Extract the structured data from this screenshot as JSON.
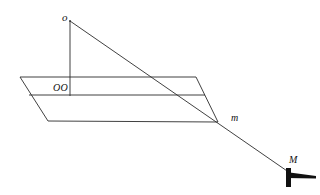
{
  "figure": {
    "background_color": "#ffffff",
    "stroke_color": "#2b2b2b",
    "support_color": "#111111",
    "labels": {
      "apex": "o",
      "plane_point": "OO",
      "mass_lower": "m",
      "mass_upper": "M"
    },
    "points": {
      "apex": {
        "x": 70,
        "y": 20
      },
      "foot": {
        "x": 70,
        "y": 95
      },
      "intersection": {
        "x": 218,
        "y": 122
      },
      "support": {
        "x": 290,
        "y": 172
      }
    },
    "plane": {
      "name": "parallelogram-plane",
      "top_left": {
        "x": 20,
        "y": 77
      },
      "top_right": {
        "x": 196,
        "y": 77
      },
      "bottom_right": {
        "x": 218,
        "y": 122
      },
      "bottom_left": {
        "x": 48,
        "y": 121
      },
      "mid_line_y": 95
    },
    "lines": [
      {
        "name": "vertical-axis",
        "from": {
          "x": 70,
          "y": 20
        },
        "to": {
          "x": 70,
          "y": 95
        }
      },
      {
        "name": "oblique-ray",
        "from": {
          "x": 70,
          "y": 20
        },
        "to": {
          "x": 290,
          "y": 172
        }
      }
    ],
    "support_symbol": {
      "name": "fixed-support",
      "post_x": 286,
      "post_top": 168,
      "post_bottom": 186,
      "ground_left": 286,
      "ground_right": 316,
      "ground_y": 175
    }
  }
}
